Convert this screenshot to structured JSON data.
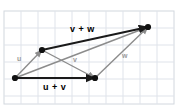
{
  "figure": {
    "width": 179,
    "height": 109,
    "background": "#ffffff",
    "grid": {
      "visible": true,
      "color": "#dfe3ea",
      "spacing": 17,
      "origin_x": 4,
      "origin_y": 11,
      "border_color": "#d2d7de"
    },
    "colors": {
      "sum_vector": "#1a1a1a",
      "component_vector": "#8c8c8c",
      "point": "#111111",
      "sum_label": "#000000",
      "component_label": "#9a9a9a"
    }
  },
  "points": [
    {
      "name": "origin",
      "x": 15,
      "y": 78
    },
    {
      "name": "u-tip",
      "x": 42,
      "y": 50
    },
    {
      "name": "v-tip",
      "x": 95,
      "y": 78
    },
    {
      "name": "w-tip",
      "x": 148,
      "y": 27
    }
  ],
  "vectors": [
    {
      "name": "u",
      "label": "u",
      "style": "component",
      "from": "origin",
      "to": "u-tip",
      "x1": 15,
      "y1": 78,
      "x2": 42,
      "y2": 50,
      "label_x": 17,
      "label_y": 55
    },
    {
      "name": "v",
      "label": "v",
      "style": "component",
      "from": "u-tip",
      "to": "v-tip",
      "x1": 42,
      "y1": 50,
      "x2": 95,
      "y2": 78,
      "label_x": 73,
      "label_y": 56
    },
    {
      "name": "w",
      "label": "w",
      "style": "component",
      "from": "v-tip",
      "to": "w-tip",
      "x1": 95,
      "y1": 78,
      "x2": 148,
      "y2": 27,
      "label_x": 122,
      "label_y": 52
    },
    {
      "name": "u-plus-v",
      "label": "u + v",
      "style": "sum",
      "from": "origin",
      "to": "v-tip",
      "x1": 15,
      "y1": 78,
      "x2": 95,
      "y2": 78,
      "label_x": 43,
      "label_y": 83
    },
    {
      "name": "v-plus-w",
      "label": "v + w",
      "style": "sum",
      "from": "u-tip",
      "to": "w-tip",
      "x1": 42,
      "y1": 50,
      "x2": 148,
      "y2": 27,
      "label_x": 70,
      "label_y": 25
    },
    {
      "name": "u-plus-v-plus-w-via-uv",
      "label": "",
      "style": "component",
      "from": "origin",
      "to": "w-tip",
      "x1": 15,
      "y1": 78,
      "x2": 148,
      "y2": 27,
      "label_x": 0,
      "label_y": 0
    }
  ]
}
